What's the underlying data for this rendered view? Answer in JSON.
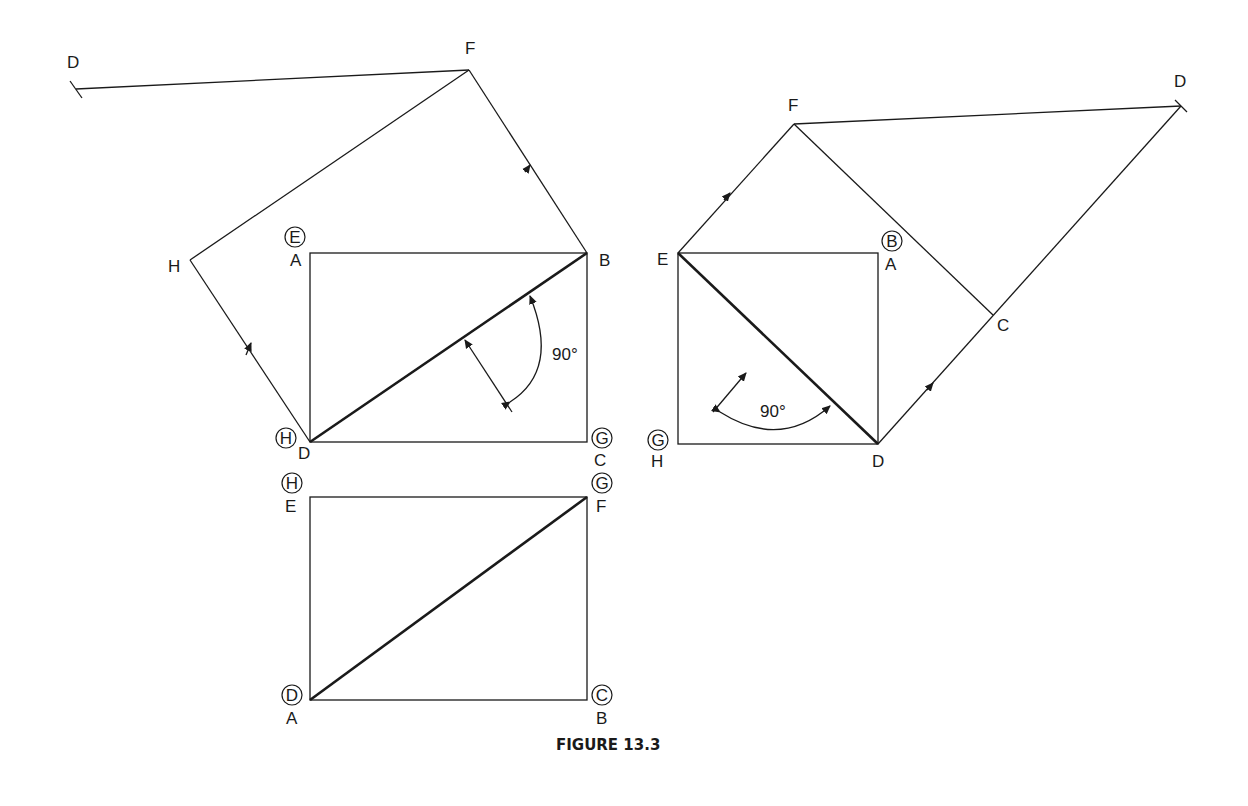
{
  "figure": {
    "caption": "FIGURE 13.3",
    "colors": {
      "ink": "#1a1a1a",
      "background": "#ffffff"
    }
  },
  "left_view": {
    "labels": {
      "D_far": "D",
      "F": "F",
      "H": "H",
      "A": "A",
      "B": "B",
      "D": "D",
      "C": "C",
      "circled_E": "E",
      "circled_H": "H",
      "circled_G": "G"
    },
    "angle": "90°"
  },
  "bottom_view": {
    "labels": {
      "E": "E",
      "F": "F",
      "A": "A",
      "B": "B",
      "circled_H": "H",
      "circled_G": "G",
      "circled_D": "D",
      "circled_C": "C"
    }
  },
  "right_view": {
    "labels": {
      "D_far": "D",
      "F": "F",
      "E": "E",
      "A": "A",
      "C": "C",
      "D": "D",
      "H": "H",
      "circled_B": "B",
      "circled_G": "G"
    },
    "angle": "90°"
  }
}
